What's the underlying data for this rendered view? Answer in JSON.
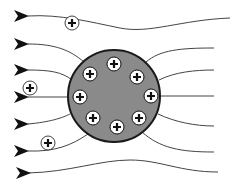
{
  "diagram": {
    "title": "Field lines around a positively charged sphere",
    "colors": {
      "background": "#ffffff",
      "line": "#444444",
      "arrow": "#111111",
      "sphere_fill": "#8a8a8a",
      "sphere_stroke": "#1a1a1a",
      "charge_fill": "#ffffff",
      "charge_stroke": "#111111"
    },
    "charge_symbol": "+",
    "sphere": {
      "cx": 114,
      "cy": 96,
      "r": 46
    },
    "arrows": [
      {
        "x": 14,
        "y": 16
      },
      {
        "x": 14,
        "y": 44
      },
      {
        "x": 14,
        "y": 70
      },
      {
        "x": 14,
        "y": 97
      },
      {
        "x": 14,
        "y": 124
      },
      {
        "x": 14,
        "y": 151
      },
      {
        "x": 16,
        "y": 173
      }
    ],
    "field_lines": [
      "M28,16 C60,14 90,22 120,28 C150,34 180,20 230,18",
      "M28,44 C55,44 70,50 84,62",
      "M28,70 C50,70 62,72 72,80",
      "M28,97 L68,97",
      "M28,124 C50,122 62,118 70,114",
      "M28,151 C55,152 72,145 88,134",
      "M28,173 C70,172 100,160 130,160 C160,160 180,172 218,172",
      "M146,62 C160,50 180,48 214,48",
      "M159,80 C175,72 195,70 214,70",
      "M160,96 L214,96",
      "M158,114 C175,122 195,126 214,126",
      "M142,132 C160,148 180,152 214,152"
    ],
    "inner_charges": [
      {
        "cx": 114,
        "cy": 64
      },
      {
        "cx": 90,
        "cy": 74
      },
      {
        "cx": 137,
        "cy": 77
      },
      {
        "cx": 80,
        "cy": 97
      },
      {
        "cx": 151,
        "cy": 96
      },
      {
        "cx": 93,
        "cy": 118
      },
      {
        "cx": 139,
        "cy": 118
      },
      {
        "cx": 117,
        "cy": 127
      }
    ],
    "outer_charges": [
      {
        "cx": 72,
        "cy": 23
      },
      {
        "cx": 30,
        "cy": 88
      },
      {
        "cx": 48,
        "cy": 143
      }
    ]
  }
}
